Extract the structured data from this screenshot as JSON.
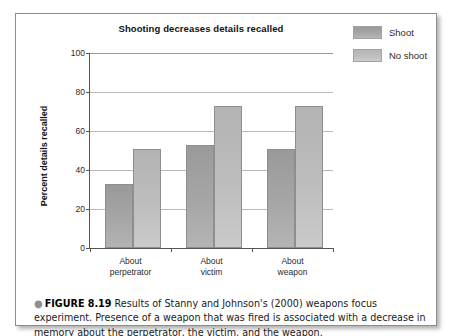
{
  "figure": {
    "caption_bullet": "●",
    "caption_label": "FIGURE 8.19",
    "caption_text": "Results of Stanny and Johnson's (2000) weapons focus experiment. Presence of a weapon that was fired is associated with a decrease in memory about the perpetrator, the victim, and the weapon."
  },
  "chart_data": {
    "type": "bar",
    "title": "Shooting decreases details recalled",
    "xlabel": "",
    "ylabel": "Percent details recalled",
    "ylim": [
      0,
      100
    ],
    "yticks": [
      0,
      20,
      40,
      60,
      80,
      100
    ],
    "ytick_labels": [
      "0",
      "20",
      "40",
      "60",
      "80",
      "100"
    ],
    "grid": true,
    "legend_position": "top-right",
    "categories": [
      "About perpetrator",
      "About victim",
      "About weapon"
    ],
    "category_lines": [
      [
        "About",
        "perpetrator"
      ],
      [
        "About",
        "victim"
      ],
      [
        "About",
        "weapon"
      ]
    ],
    "series": [
      {
        "name": "Shoot",
        "color": "#a2a2a2",
        "values": [
          33,
          53,
          51
        ]
      },
      {
        "name": "No shoot",
        "color": "#bcbcbc",
        "values": [
          51,
          73,
          73
        ]
      }
    ]
  }
}
